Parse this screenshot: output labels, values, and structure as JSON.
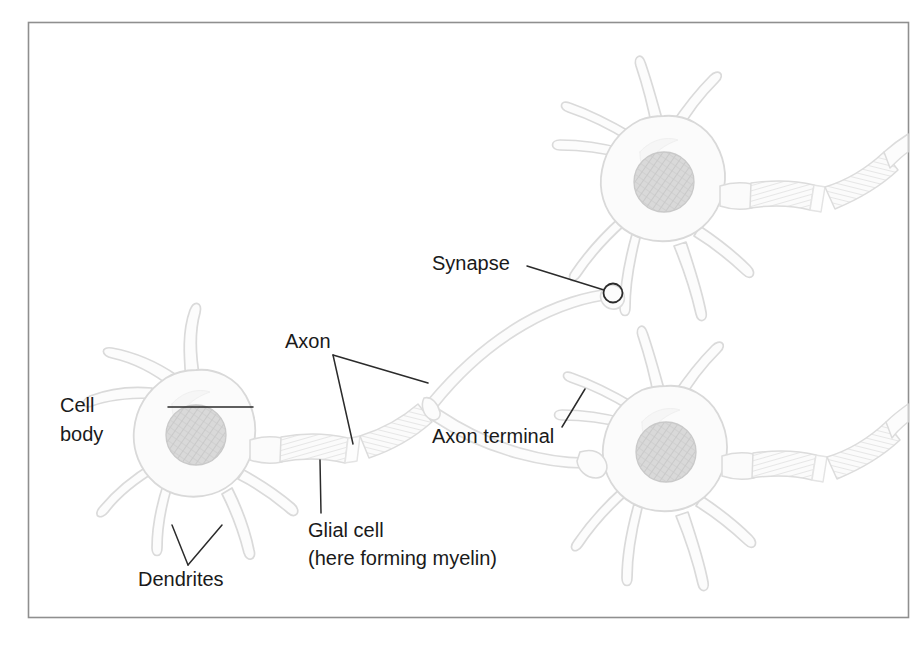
{
  "figure": {
    "border_color": "#8f8f8f",
    "background_color": "#ffffff",
    "outline_color": "#d8d8d8",
    "soma_fill": "#fbfbfb",
    "nucleus_fill": "#d6d6d6",
    "nucleus_hatch_color": "#bdbdbd",
    "myelin_fill": "#fafafa",
    "myelin_stripe_color": "#e2e2e2",
    "leader_line_color": "#2b2b2b",
    "label_color": "#1a1a1a",
    "label_font_size": 20
  },
  "labels": [
    {
      "id": "synapse",
      "name": "synapse-label",
      "lines": [
        "Synapse"
      ],
      "x": 432,
      "y": 270,
      "anchor": "start"
    },
    {
      "id": "axon",
      "name": "axon-label",
      "lines": [
        "Axon"
      ],
      "x": 285,
      "y": 348,
      "anchor": "start"
    },
    {
      "id": "cell_body",
      "name": "cell-body-label",
      "lines": [
        "Cell",
        "body"
      ],
      "x": 60,
      "y": 412,
      "anchor": "start"
    },
    {
      "id": "axon_terminal",
      "name": "axon-terminal-label",
      "lines": [
        "Axon terminal"
      ],
      "x": 432,
      "y": 443,
      "anchor": "start"
    },
    {
      "id": "glial_cell",
      "name": "glial-cell-label",
      "lines": [
        "Glial cell",
        "(here forming myelin)"
      ],
      "x": 308,
      "y": 537,
      "anchor": "start"
    },
    {
      "id": "dendrites",
      "name": "dendrites-label",
      "lines": [
        "Dendrites"
      ],
      "x": 138,
      "y": 586,
      "anchor": "start"
    }
  ],
  "structures": {
    "neurons": [
      {
        "id": "neuron-left",
        "center_x": 196,
        "center_y": 435,
        "nucleus_r": 30
      },
      {
        "id": "neuron-top-right",
        "center_x": 664,
        "center_y": 182,
        "nucleus_r": 30
      },
      {
        "id": "neuron-bottom-right",
        "center_x": 666,
        "center_y": 452,
        "nucleus_r": 30
      }
    ],
    "synapse_marker": {
      "cx": 613,
      "cy": 293,
      "r": 9
    }
  }
}
